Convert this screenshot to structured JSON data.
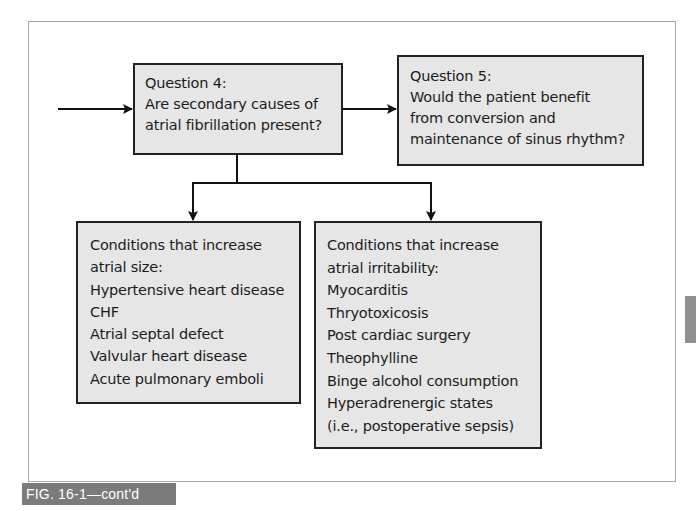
{
  "figure": {
    "caption": "FIG. 16-1—cont'd",
    "colors": {
      "box_fill": "#e6e6e6",
      "box_border": "#222222",
      "frame_border": "#a9a9a9",
      "caption_bg": "#7b7b7b",
      "caption_text": "#ffffff",
      "side_tab": "#8f8f8f"
    }
  },
  "nodes": {
    "question4": {
      "lines": [
        "Question 4:",
        "Are secondary causes of",
        "atrial fibrillation present?"
      ]
    },
    "question5": {
      "lines": [
        "Question 5:",
        "Would the patient benefit",
        "from conversion and",
        "maintenance of sinus rhythm?"
      ]
    },
    "atrial_size": {
      "lines": [
        "Conditions that increase",
        "atrial size:",
        "Hypertensive heart disease",
        "CHF",
        "Atrial septal defect",
        "Valvular heart disease",
        "Acute pulmonary emboli"
      ]
    },
    "atrial_irritability": {
      "lines": [
        "Conditions that increase",
        "atrial irritability:",
        "Myocarditis",
        "Thryotoxicosis",
        "Post cardiac surgery",
        "Theophylline",
        "Binge alcohol consumption",
        "Hyperadrenergic states",
        "(i.e., postoperative sepsis)"
      ]
    }
  },
  "edges": [
    {
      "from": "incoming",
      "to": "question4",
      "type": "arrow"
    },
    {
      "from": "question4",
      "to": "question5",
      "type": "arrow"
    },
    {
      "from": "question4",
      "to": "atrial_size",
      "type": "arrow"
    },
    {
      "from": "question4",
      "to": "atrial_irritability",
      "type": "arrow"
    }
  ]
}
